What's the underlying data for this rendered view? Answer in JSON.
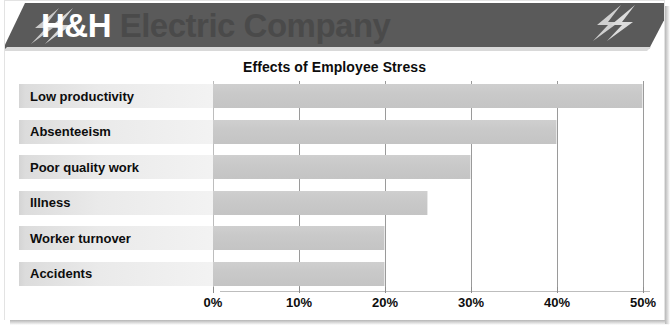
{
  "brand": {
    "name_highlight": "H&H",
    "name_rest": " Electric Company",
    "banner_color": "#5a5a5a",
    "highlight_color": "#ffffff",
    "rest_color": "#4a4a4a",
    "bolt_left_icon": "lightning-bolt-icon",
    "bolt_right_icon": "lightning-bolt-icon"
  },
  "chart_data": {
    "type": "bar",
    "orientation": "horizontal",
    "title": "Effects of Employee Stress",
    "xlabel": "",
    "ylabel": "",
    "categories": [
      "Low productivity",
      "Absenteeism",
      "Poor quality work",
      "Illness",
      "Worker turnover",
      "Accidents"
    ],
    "values": [
      50,
      40,
      30,
      25,
      20,
      20
    ],
    "value_unit": "%",
    "xlim": [
      0,
      50
    ],
    "xticks": [
      0,
      10,
      20,
      30,
      40,
      50
    ],
    "xtick_labels": [
      "0%",
      "10%",
      "20%",
      "30%",
      "40%",
      "50%"
    ],
    "grid": "vertical",
    "legend": "none",
    "bar_color": "#c8c8c8",
    "label_band_color": "#eaeaea",
    "gridline_color": "#9a9a9a"
  }
}
